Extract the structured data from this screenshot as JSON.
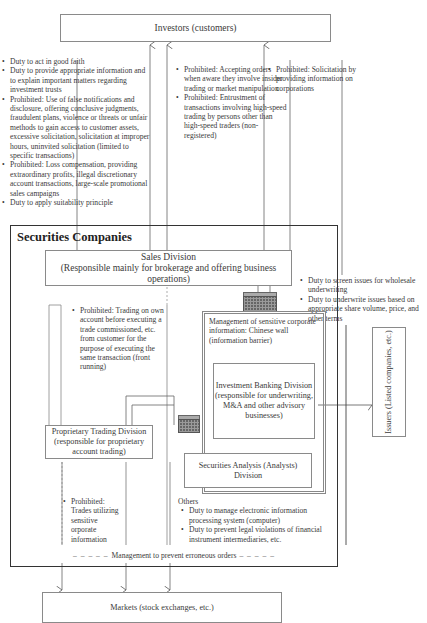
{
  "investors": {
    "label": "Investors (customers)"
  },
  "investor_duties": {
    "items": [
      "Duty to act in good faith",
      "Duty to provide appropriate information and to explain important matters regarding investment trusts",
      "Prohibited: Use of false notifications and disclosure, offering conclusive judgments, fraudulent plans, violence or threats or unfair methods to gain access to customer assets, excessive solicitation, solicitation at improper hours, uninvited solicitation (limited to specific transactions)",
      "Prohibited: Loss compensation, providing extraordinary profits, illegal discretionary account transactions, large-scale promotional sales campaigns",
      "Duty to apply suitability principle"
    ]
  },
  "order_prohibitions": {
    "items": [
      "Prohibited: Accepting orders when aware they involve insider trading or market manipulation",
      "Prohibited: Entrustment of transactions involving high-speed trading by persons other than high-speed traders (non-registered)"
    ]
  },
  "solicitation_prohibition": {
    "items": [
      "Prohibited: Solicitation by providing information on corporations"
    ]
  },
  "securities_companies": {
    "title": "Securities Companies"
  },
  "sales_division": {
    "name": "Sales Division",
    "desc": "(Responsible mainly for brokerage and offering business operations)"
  },
  "underwriting_duties": {
    "items": [
      "Duty to screen issues for wholesale underwriting",
      "Duty to underwrite issues based on appropriate share volume, price, and other terms"
    ]
  },
  "front_running": {
    "items": [
      "Prohibited: Trading on own account before executing a trade commissioned, etc. from customer for the purpose of executing the same transaction (front running)"
    ]
  },
  "chinese_wall": {
    "label": "Management of sensitive corporate information: Chinese wall (information barrier)"
  },
  "investment_banking": {
    "label": "Investment Banking Division (responsible for underwriting, M&A and other advisory businesses)"
  },
  "securities_analysis": {
    "label": "Securities Analysis (Analysts) Division"
  },
  "proprietary_trading": {
    "label": "Proprietary Trading Division (responsible for proprietary account trading)"
  },
  "proprietary_prohibition": {
    "items": [
      "Prohibited: Trades utilizing sensitive orporate information"
    ]
  },
  "others": {
    "title": "Others",
    "items": [
      "Duty to manage electronic information processing system (computer)",
      "Duty to prevent legal violations of financial instrument intermediaries, etc."
    ]
  },
  "erroneous_orders": {
    "label": "Management to prevent erroneous orders"
  },
  "issuers": {
    "label": "Issuers (Listed companies, etc.)"
  },
  "markets": {
    "label": "Markets (stock exchanges, etc.)"
  }
}
